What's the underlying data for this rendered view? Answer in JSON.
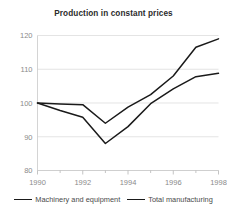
{
  "chart_data": {
    "type": "line",
    "title": "Production in constant prices",
    "xlabel": "",
    "ylabel": "",
    "x": [
      1990,
      1991,
      1992,
      1993,
      1994,
      1995,
      1996,
      1997,
      1998
    ],
    "xlim": [
      1990,
      1998
    ],
    "ylim": [
      80,
      120
    ],
    "xticks": [
      1990,
      1992,
      1994,
      1996,
      1998
    ],
    "xtick_labels": [
      "1990",
      "1992",
      "1994",
      "1996",
      "1998"
    ],
    "xminor_ticks": [
      1991,
      1993,
      1995,
      1997
    ],
    "yticks": [
      80,
      90,
      100,
      110,
      120
    ],
    "ytick_labels": [
      "80",
      "90",
      "100",
      "110",
      "120"
    ],
    "grid": true,
    "grid_axis": "y",
    "legend_position": "bottom",
    "series": [
      {
        "name": "Machinery and equipment",
        "color": "#1a1a1a",
        "values": [
          100,
          97.8,
          95.8,
          88,
          93,
          99.8,
          104.2,
          107.8,
          108.8
        ]
      },
      {
        "name": "Total manufacturing",
        "color": "#1a1a1a",
        "values": [
          100,
          99.7,
          99.5,
          94,
          98.8,
          102.5,
          108,
          116.5,
          119
        ]
      }
    ]
  },
  "legend": {
    "items": [
      {
        "label": "Machinery and equipment"
      },
      {
        "label": "Total manufacturing"
      }
    ]
  }
}
